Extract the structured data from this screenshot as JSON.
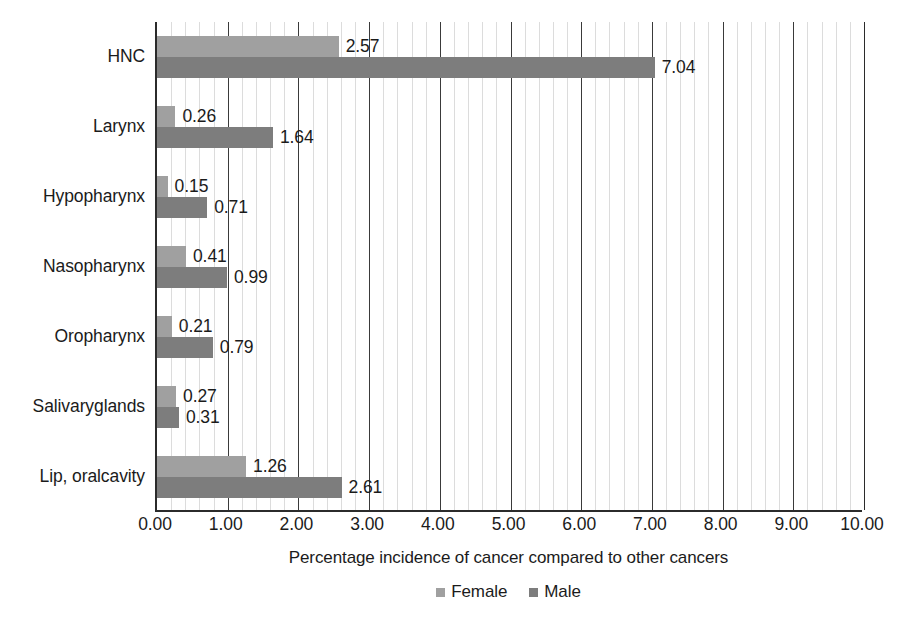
{
  "chart_data": {
    "type": "bar",
    "orientation": "horizontal",
    "title": "",
    "xlabel": "Percentage incidence of cancer compared to other cancers",
    "ylabel": "",
    "xlim": [
      0,
      10
    ],
    "x_tick_step": 1,
    "x_minor_step": 0.2,
    "grid": true,
    "legend_position": "bottom",
    "value_label_format": "2dp",
    "categories": [
      "HNC",
      "Larynx",
      "Hypopharynx",
      "Nasopharynx",
      "Oropharynx",
      "Salivaryglands",
      "Lip, oralcavity"
    ],
    "x_tick_labels": [
      "0.00",
      "1.00",
      "2.00",
      "3.00",
      "4.00",
      "5.00",
      "6.00",
      "7.00",
      "8.00",
      "9.00",
      "10.00"
    ],
    "series": [
      {
        "name": "Female",
        "color": "#a0a0a0",
        "values": [
          2.57,
          0.26,
          0.15,
          0.41,
          0.21,
          0.27,
          1.26
        ],
        "value_labels": [
          "2.57",
          "0.26",
          "0.15",
          "0.41",
          "0.21",
          "0.27",
          "1.26"
        ]
      },
      {
        "name": "Male",
        "color": "#7d7d7d",
        "values": [
          7.04,
          1.64,
          0.71,
          0.99,
          0.79,
          0.31,
          2.61
        ],
        "value_labels": [
          "7.04",
          "1.64",
          "0.71",
          "0.99",
          "0.79",
          "0.31",
          "2.61"
        ]
      }
    ]
  },
  "legend": {
    "items": [
      {
        "label": "Female",
        "color": "#a0a0a0"
      },
      {
        "label": "Male",
        "color": "#7d7d7d"
      }
    ]
  },
  "colors": {
    "female": "#a0a0a0",
    "male": "#7d7d7d",
    "axis": "#2b2b2b",
    "major_gridline": "#3a3a3a",
    "minor_gridline": "#dcdcdc",
    "text": "#1b1b1b",
    "background": "#ffffff"
  }
}
